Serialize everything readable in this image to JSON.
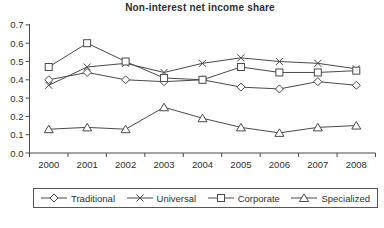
{
  "window": {
    "background": "#ffffff"
  },
  "chart_data": {
    "type": "line",
    "title": "Non-interest net income share",
    "categories": [
      "2000",
      "2001",
      "2002",
      "2003",
      "2004",
      "2005",
      "2006",
      "2007",
      "2008"
    ],
    "series": [
      {
        "name": "Traditional",
        "marker": "diamond",
        "values": [
          0.4,
          0.44,
          0.4,
          0.39,
          0.4,
          0.36,
          0.35,
          0.39,
          0.37
        ]
      },
      {
        "name": "Universal",
        "marker": "x",
        "values": [
          0.37,
          0.47,
          0.49,
          0.44,
          0.49,
          0.52,
          0.5,
          0.49,
          0.46
        ]
      },
      {
        "name": "Corporate",
        "marker": "square",
        "values": [
          0.47,
          0.6,
          0.5,
          0.41,
          0.4,
          0.47,
          0.44,
          0.44,
          0.45
        ]
      },
      {
        "name": "Specialized",
        "marker": "triangle",
        "values": [
          0.13,
          0.14,
          0.13,
          0.25,
          0.19,
          0.14,
          0.11,
          0.14,
          0.15
        ]
      }
    ],
    "xlabel": "",
    "ylabel": "",
    "ylim": [
      0.0,
      0.7
    ],
    "ytick_labels": [
      "0.0",
      "0.1",
      "0.2",
      "0.3",
      "0.4",
      "0.5",
      "0.6",
      "0.7"
    ],
    "grid": false,
    "legend_position": "bottom",
    "line_color": "#4a4a4a",
    "marker_fill": "#ffffff",
    "text_color": "#2f2f2f"
  }
}
